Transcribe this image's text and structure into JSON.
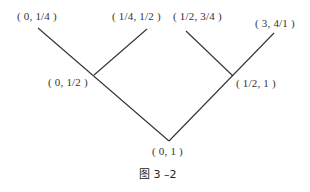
{
  "diagram": {
    "type": "tree",
    "caption": "图 3 –2",
    "nodes": [
      {
        "id": "root",
        "label": "( 0, 1 )"
      },
      {
        "id": "left",
        "label": "( 0, 1/2 )"
      },
      {
        "id": "right",
        "label": "( 1/2, 1 )"
      },
      {
        "id": "ll",
        "label": "( 0, 1/4 )"
      },
      {
        "id": "lr",
        "label": "( 1/4, 1/2 )"
      },
      {
        "id": "rl",
        "label": "( 1/2, 3/4 )"
      },
      {
        "id": "rr",
        "label": "( 3, 4/1 )"
      }
    ],
    "edges": [
      [
        "root",
        "left"
      ],
      [
        "root",
        "right"
      ],
      [
        "left",
        "ll"
      ],
      [
        "left",
        "lr"
      ],
      [
        "right",
        "rl"
      ],
      [
        "right",
        "rr"
      ]
    ]
  }
}
